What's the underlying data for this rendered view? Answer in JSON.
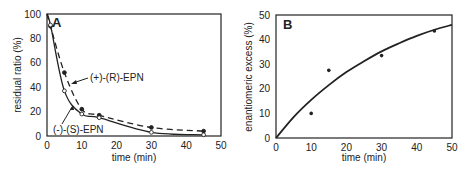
{
  "chart_data": [
    {
      "type": "line",
      "panel": "A",
      "title": "",
      "xlabel": "time (min)",
      "ylabel": "residual ratio (%)",
      "xlim": [
        0,
        50
      ],
      "ylim": [
        0,
        100
      ],
      "xticks": [
        0,
        10,
        20,
        30,
        40,
        50
      ],
      "yticks": [
        0,
        20,
        40,
        60,
        80,
        100
      ],
      "grid": false,
      "series": [
        {
          "name": "(+)-(R)-EPN",
          "marker": "filled-circle",
          "line": "dashed",
          "x": [
            0,
            1,
            5,
            10,
            15,
            30,
            45
          ],
          "values": [
            100,
            90,
            52,
            22,
            17,
            7,
            4
          ]
        },
        {
          "name": "(-)-(S)-EPN",
          "marker": "open-circle",
          "line": "solid",
          "x": [
            0,
            1,
            5,
            10,
            15,
            30,
            45
          ],
          "values": [
            100,
            91,
            37,
            18,
            15,
            3,
            1
          ]
        }
      ],
      "annotations": [
        "(+)-(R)-EPN",
        "(-)-(S)-EPN"
      ]
    },
    {
      "type": "scatter",
      "panel": "B",
      "title": "",
      "xlabel": "time (min)",
      "ylabel": "enantiomeric excess (%)",
      "xlim": [
        0,
        50
      ],
      "ylim": [
        0,
        50
      ],
      "xticks": [
        0,
        10,
        20,
        30,
        40,
        50
      ],
      "yticks": [
        0,
        10,
        20,
        30,
        40,
        50
      ],
      "grid": false,
      "series": [
        {
          "name": "ee data",
          "marker": "filled-circle",
          "x": [
            0,
            10,
            15,
            30,
            45
          ],
          "values": [
            0,
            10,
            27.5,
            33.5,
            43.5
          ]
        },
        {
          "name": "fit curve",
          "line": "solid",
          "x": [
            0,
            5,
            10,
            15,
            20,
            25,
            30,
            35,
            40,
            45,
            50
          ],
          "values": [
            0,
            8.5,
            15.5,
            21.5,
            26.8,
            31.2,
            35.2,
            38.5,
            41.5,
            44,
            46
          ]
        }
      ]
    }
  ],
  "panels": {
    "a": {
      "label": "A",
      "xlabel": "time (min)",
      "ylabel": "residual ratio (%)",
      "label_r": "(+)-(R)-EPN",
      "label_s": "(-)-(S)-EPN"
    },
    "b": {
      "label": "B",
      "xlabel": "time (min)",
      "ylabel": "enantiomeric excess (%)"
    }
  },
  "colors": {
    "ink": "#222222",
    "background": "#ffffff"
  }
}
